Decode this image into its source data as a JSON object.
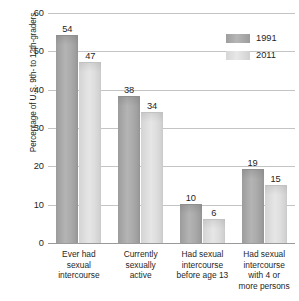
{
  "chart_data": {
    "type": "bar",
    "title": "",
    "subtitle": "",
    "xlabel": "",
    "ylabel": "Percentage of U.S. 9th- to 12th-graders",
    "ylim": [
      0,
      60
    ],
    "yticks": [
      0,
      10,
      20,
      30,
      40,
      50,
      60
    ],
    "ytick_labels": [
      "0",
      "10",
      "20",
      "30",
      "40",
      "50",
      "60"
    ],
    "grid": true,
    "legend_position": "top-right",
    "categories": [
      "Ever had sexual intercourse",
      "Currently sexually active",
      "Had sexual intercourse before age 13",
      "Had sexual intercourse with 4 or more persons"
    ],
    "category_lines": [
      [
        "Ever had",
        "sexual",
        "intercourse"
      ],
      [
        "Currently",
        "sexually",
        "active"
      ],
      [
        "Had sexual",
        "intercourse",
        "before age 13"
      ],
      [
        "Had sexual",
        "intercourse",
        "with 4 or",
        "more persons"
      ]
    ],
    "series": [
      {
        "name": "1991",
        "color": "#a9a9a9",
        "values": [
          54,
          38,
          10,
          19
        ],
        "value_labels": [
          "54",
          "38",
          "10",
          "19"
        ]
      },
      {
        "name": "2011",
        "color": "#dcdcdc",
        "values": [
          47,
          34,
          6,
          15
        ],
        "value_labels": [
          "47",
          "34",
          "6",
          "15"
        ]
      }
    ]
  },
  "legend": {
    "entries": [
      {
        "label": "1991"
      },
      {
        "label": "2011"
      }
    ]
  },
  "axes": {
    "y_title": "Percentage of U.S. 9th- to 12th-graders"
  }
}
